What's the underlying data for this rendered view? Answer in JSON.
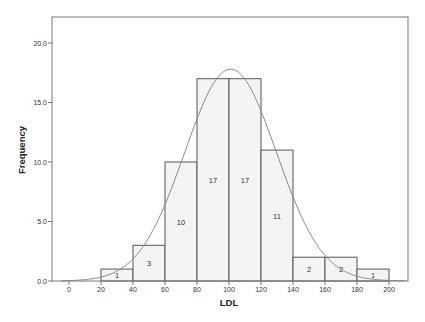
{
  "chart_data": {
    "type": "bar",
    "subtype": "histogram",
    "title": "",
    "xlabel": "LDL",
    "ylabel": "Frequency",
    "bins": [
      {
        "start": 20,
        "end": 40,
        "count": 1
      },
      {
        "start": 40,
        "end": 60,
        "count": 3
      },
      {
        "start": 60,
        "end": 80,
        "count": 10
      },
      {
        "start": 80,
        "end": 100,
        "count": 17
      },
      {
        "start": 100,
        "end": 120,
        "count": 17
      },
      {
        "start": 120,
        "end": 140,
        "count": 11
      },
      {
        "start": 140,
        "end": 160,
        "count": 2
      },
      {
        "start": 160,
        "end": 180,
        "count": 2
      },
      {
        "start": 180,
        "end": 200,
        "count": 1
      }
    ],
    "categories": [
      "20-40",
      "40-60",
      "60-80",
      "80-100",
      "100-120",
      "120-140",
      "140-160",
      "160-180",
      "180-200"
    ],
    "values": [
      1,
      3,
      10,
      17,
      17,
      11,
      2,
      2,
      1
    ],
    "x_ticks": [
      0,
      20,
      40,
      60,
      80,
      100,
      120,
      140,
      160,
      180,
      200
    ],
    "y_ticks": [
      "0.0",
      "5.0",
      "10.0",
      "15.0",
      "20.0"
    ],
    "y_tick_values": [
      0,
      5,
      10,
      15,
      20
    ],
    "xlim": [
      -10,
      212
    ],
    "ylim": [
      0,
      22.2
    ],
    "grid": false,
    "legend": null,
    "overlay": {
      "type": "normal-curve",
      "mean": 101,
      "sd": 28.7,
      "peak": 17.8
    },
    "bar_labels_visible": true
  },
  "colors": {
    "bar_fill": "#f4f4f4",
    "bar_stroke": "#555555",
    "curve": "#8a8a8a",
    "frame": "#777777",
    "text": "#333333"
  }
}
